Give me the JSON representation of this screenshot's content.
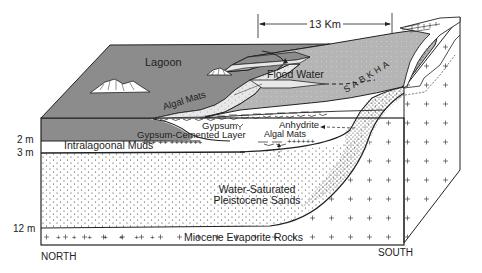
{
  "diagram": {
    "type": "geologic block diagram (cross-section)",
    "scale": {
      "label": "13 Km"
    },
    "surface_labels": {
      "lagoon": "Lagoon",
      "flood_water": "Flood Water",
      "sabkha": "SABKHA",
      "algal_mats_surface": "Algal Mats"
    },
    "section_labels": {
      "gypsum": "Gypsum",
      "anhydrite": "Anhydrite",
      "gypsum_cemented_layer": "Gypsum-Cemented Layer",
      "algal_mats_section": "Algal Mats",
      "intralagoonal_muds": "Intralagoonal Muds",
      "pleistocene_line1": "Water-Saturated",
      "pleistocene_line2": "Pleistocene Sands",
      "miocene": "Miocene Evaporite Rocks"
    },
    "depth_ticks": [
      "2 m",
      "3 m",
      "12 m"
    ],
    "directions": {
      "left": "NORTH",
      "right": "SOUTH"
    },
    "colors": {
      "lagoon_fill": "#8c8c8c",
      "sabkha_fill": "#b4b4b4",
      "line": "#222222",
      "background": "#ffffff"
    }
  }
}
